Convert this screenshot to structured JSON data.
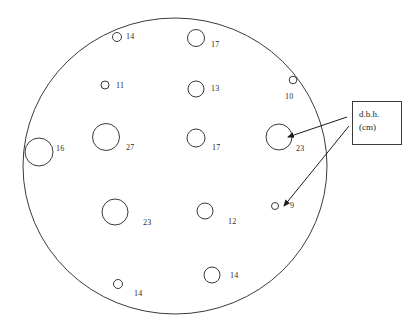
{
  "figure": {
    "stroke_color": "#3a3a3a",
    "label_color": "#2a2a2a",
    "background": "#ffffff"
  },
  "legend": {
    "name": "dbh-legend",
    "line1": "d.b.h.",
    "line2": "(cm)",
    "box": {
      "x": 352,
      "y": 101,
      "width": 50,
      "height": 44
    }
  },
  "plot_boundary": {
    "name": "sample-plot-boundary",
    "cx": 175,
    "cy": 166,
    "rx": 152,
    "ry": 148
  },
  "leaders": [
    {
      "name": "leader-to-tree-23",
      "from_x": 347,
      "from_y": 117,
      "to_x": 288,
      "to_y": 137,
      "target_value": 23
    },
    {
      "name": "leader-to-tree-9",
      "from_x": 349,
      "from_y": 126,
      "to_x": 284,
      "to_y": 206,
      "target_value": 9
    }
  ],
  "chart_data": {
    "type": "scatter",
    "xlabel": "",
    "ylabel": "",
    "legend_position": "right",
    "annotations": [
      "d.b.h.",
      "(cm)"
    ],
    "value_unit": "cm",
    "value_name": "d.b.h.",
    "point_count": 14,
    "values": [
      14,
      17,
      11,
      13,
      10,
      16,
      27,
      17,
      23,
      23,
      12,
      9,
      14,
      14
    ],
    "points": [
      {
        "id": "tree-1",
        "value": 14,
        "label": "14",
        "cx": 117,
        "cy": 37,
        "r": 4.5,
        "label_x": 126,
        "label_y": 33
      },
      {
        "id": "tree-2",
        "value": 17,
        "label": "17",
        "cx": 196,
        "cy": 38,
        "r": 8.5,
        "label_x": 211,
        "label_y": 41
      },
      {
        "id": "tree-3",
        "value": 11,
        "label": "11",
        "cx": 105,
        "cy": 85,
        "r": 4.0,
        "label_x": 116,
        "label_y": 82
      },
      {
        "id": "tree-4",
        "value": 13,
        "label": "13",
        "cx": 196,
        "cy": 89,
        "r": 8.0,
        "label_x": 211,
        "label_y": 85
      },
      {
        "id": "tree-5",
        "value": 10,
        "label": "10",
        "cx": 293,
        "cy": 80,
        "r": 3.8,
        "label_x": 285,
        "label_y": 93
      },
      {
        "id": "tree-6",
        "value": 16,
        "label": "16",
        "cx": 39,
        "cy": 152,
        "r": 14.0,
        "label_x": 56,
        "label_y": 145
      },
      {
        "id": "tree-7",
        "value": 27,
        "label": "27",
        "cx": 106,
        "cy": 137,
        "r": 13.5,
        "label_x": 126,
        "label_y": 144
      },
      {
        "id": "tree-8",
        "value": 17,
        "label": "17",
        "cx": 196,
        "cy": 138,
        "r": 9.0,
        "label_x": 212,
        "label_y": 144
      },
      {
        "id": "tree-9",
        "value": 23,
        "label": "23",
        "cx": 279,
        "cy": 137,
        "r": 13.0,
        "label_x": 296,
        "label_y": 145
      },
      {
        "id": "tree-10",
        "value": 23,
        "label": "23",
        "cx": 115,
        "cy": 212,
        "r": 13.0,
        "label_x": 143,
        "label_y": 219
      },
      {
        "id": "tree-11",
        "value": 12,
        "label": "12",
        "cx": 205,
        "cy": 211,
        "r": 8.0,
        "label_x": 228,
        "label_y": 218
      },
      {
        "id": "tree-12",
        "value": 9,
        "label": "9",
        "cx": 275,
        "cy": 206,
        "r": 3.5,
        "label_x": 290,
        "label_y": 202
      },
      {
        "id": "tree-13",
        "value": 14,
        "label": "14",
        "cx": 118,
        "cy": 284,
        "r": 4.5,
        "label_x": 134,
        "label_y": 290
      },
      {
        "id": "tree-14",
        "value": 14,
        "label": "14",
        "cx": 212,
        "cy": 275,
        "r": 8.0,
        "label_x": 230,
        "label_y": 272
      }
    ]
  }
}
